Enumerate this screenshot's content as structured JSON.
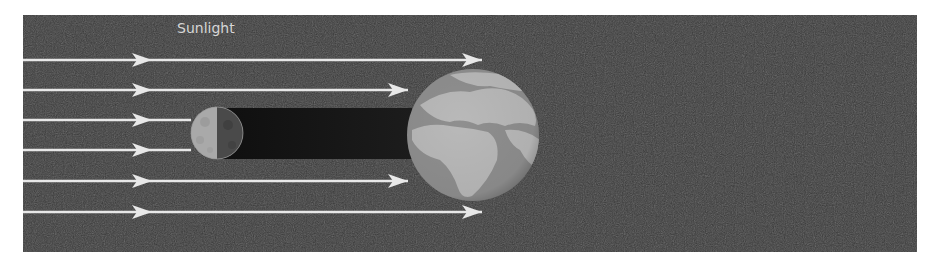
{
  "diagram": {
    "title_label": "Sunlight",
    "bodies": {
      "moon": {
        "name": "Moon",
        "lit_side": "left"
      },
      "earth": {
        "name": "Earth",
        "shadow": "umbra toward the Moon"
      }
    },
    "rays": [
      {
        "id": "ray-1",
        "stops_at": "past-earth"
      },
      {
        "id": "ray-2",
        "stops_at": "earth"
      },
      {
        "id": "ray-3",
        "stops_at": "moon"
      },
      {
        "id": "ray-4",
        "stops_at": "moon"
      },
      {
        "id": "ray-5",
        "stops_at": "earth"
      },
      {
        "id": "ray-6",
        "stops_at": "past-earth"
      }
    ],
    "colors": {
      "background": "#3a3a3a",
      "ray": "#e8e8e8",
      "shadow": "#141414",
      "earth_land": "#b9b9b9",
      "earth_sea": "#8f8f8f",
      "moon_lit": "#a9a9a9",
      "moon_dark": "#4a4a4a"
    }
  }
}
